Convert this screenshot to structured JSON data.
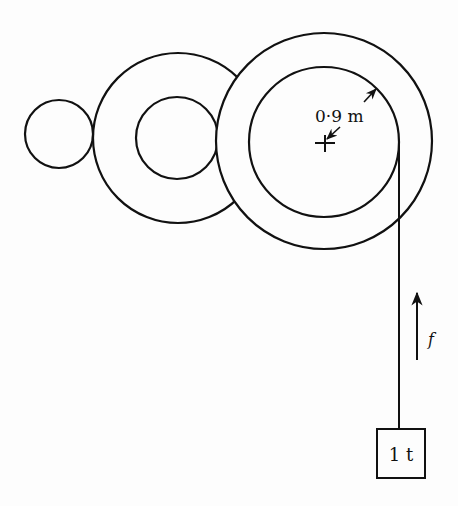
{
  "diagram": {
    "type": "gear-train-hoist",
    "gears": [
      {
        "name": "small-gear",
        "cx": 59,
        "cy": 134,
        "r": 34
      },
      {
        "name": "middle-gear",
        "cx": 178,
        "cy": 138,
        "r_outer": 85,
        "r_inner": 41
      },
      {
        "name": "large-gear",
        "cx": 324,
        "cy": 141,
        "r_outer": 108,
        "r_drum": 75
      }
    ],
    "drum_radius_label": "0·9 m",
    "force_label": "f",
    "load_label": "1 t",
    "colors": {
      "line": "#111111",
      "background": "#fdfdfd"
    }
  }
}
